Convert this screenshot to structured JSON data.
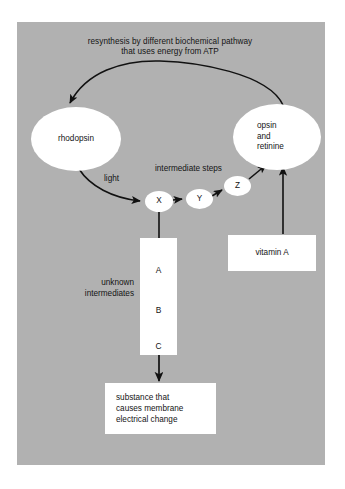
{
  "diagram": {
    "type": "flow-diagram",
    "background_color": "#b1b1b1",
    "node_fill_color": "#ffffff",
    "stroke_color": "#111111",
    "title": "resynthesis by different biochemical pathway\nthat uses energy from ATP",
    "nodes": {
      "rhodopsin": {
        "label": "rhodopsin",
        "shape": "ellipse"
      },
      "opsin": {
        "label": "opsin\nand\nretinine",
        "shape": "ellipse"
      },
      "x": {
        "label": "X",
        "shape": "ellipse"
      },
      "y": {
        "label": "Y",
        "shape": "ellipse"
      },
      "z": {
        "label": "Z",
        "shape": "ellipse"
      },
      "vitamin_a": {
        "label": "vitamin A",
        "shape": "rect"
      },
      "substance": {
        "label": "substance that\ncauses membrane\nelectrical change",
        "shape": "rect"
      },
      "intermediates": {
        "shape": "rect",
        "letters": [
          "A",
          "B",
          "C"
        ]
      }
    },
    "labels": {
      "light": "light",
      "intermediate_steps": "intermediate steps",
      "unknown_intermediates": "unknown\nintermediates"
    },
    "edges": [
      {
        "from": "opsin",
        "to": "rhodopsin",
        "style": "curved-arc",
        "annotation": "resynthesis by different biochemical pathway that uses energy from ATP"
      },
      {
        "from": "rhodopsin",
        "to": "x",
        "style": "curved",
        "annotation": "light"
      },
      {
        "from": "x",
        "to": "y",
        "style": "straight",
        "annotation": "intermediate steps"
      },
      {
        "from": "y",
        "to": "z",
        "style": "straight"
      },
      {
        "from": "z",
        "to": "opsin",
        "style": "straight-diagonal"
      },
      {
        "from": "vitamin_a",
        "to": "opsin",
        "style": "straight-vertical"
      },
      {
        "from": "x",
        "to": "intermediates",
        "style": "straight-vertical"
      },
      {
        "from": "intermediates",
        "to": "substance",
        "style": "straight-vertical"
      }
    ]
  }
}
